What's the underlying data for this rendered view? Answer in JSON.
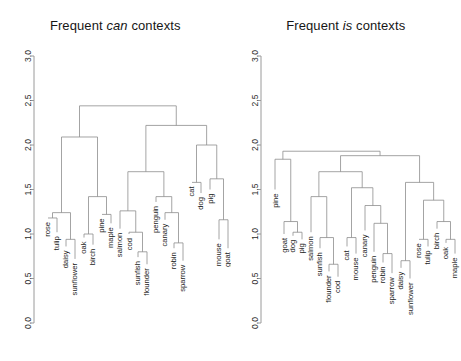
{
  "figure": {
    "background": "#ffffff",
    "line_color": "#8d8d8d",
    "axis_color": "#9a9a9a",
    "text_color": "#1c1c1c"
  },
  "panels": [
    {
      "id": "can-panel",
      "title_prefix": "Frequent ",
      "title_italic": "can",
      "title_suffix": " contexts",
      "title_full": "Frequent can contexts"
    },
    {
      "id": "is-panel",
      "title_prefix": "Frequent ",
      "title_italic": "is",
      "title_suffix": " contexts",
      "title_full": "Frequent is contexts"
    }
  ],
  "axis": {
    "ticks": [
      "0.0",
      "0.5",
      "1.0",
      "1.5",
      "2.0",
      "2.5",
      "3.0"
    ],
    "values": [
      0.0,
      0.5,
      1.0,
      1.5,
      2.0,
      2.5,
      3.0
    ],
    "ylim": [
      0.0,
      3.0
    ],
    "ylabel": ""
  },
  "chart_data": [
    {
      "type": "dendrogram",
      "title": "Frequent can contexts",
      "xlabel": "",
      "ylabel": "",
      "ylim": [
        0.0,
        3.0
      ],
      "grid": false,
      "yticks": [
        0.0,
        0.5,
        1.0,
        1.5,
        2.0,
        2.5,
        3.0
      ],
      "leaves": [
        "rose",
        "tulip",
        "daisy",
        "sunflower",
        "oak",
        "birch",
        "pine",
        "maple",
        "salmon",
        "cod",
        "sunfish",
        "flounder",
        "penguin",
        "canary",
        "robin",
        "sparrow",
        "cat",
        "dog",
        "pig",
        "mouse",
        "goat"
      ],
      "leaf_heights": [
        1.18,
        1.02,
        0.86,
        0.72,
        0.96,
        0.88,
        1.22,
        1.12,
        1.06,
        1.0,
        0.74,
        0.66,
        1.36,
        1.16,
        0.84,
        0.7,
        1.58,
        1.46,
        1.5,
        0.94,
        0.84
      ],
      "merges": [
        {
          "id": "m_rose_tulip",
          "left": "rose",
          "right": "tulip",
          "height": 1.18
        },
        {
          "id": "m_daisy_sunflower",
          "left": "daisy",
          "right": "sunflower",
          "height": 0.94
        },
        {
          "id": "m_flowers",
          "left": "m_rose_tulip",
          "right": "m_daisy_sunflower",
          "height": 1.24
        },
        {
          "id": "m_oak_birch",
          "left": "oak",
          "right": "birch",
          "height": 1.0
        },
        {
          "id": "m_pine_maple",
          "left": "pine",
          "right": "maple",
          "height": 1.22
        },
        {
          "id": "m_trees",
          "left": "m_oak_birch",
          "right": "m_pine_maple",
          "height": 1.42
        },
        {
          "id": "m_plants",
          "left": "m_flowers",
          "right": "m_trees",
          "height": 2.09
        },
        {
          "id": "m_sunfish_flounder",
          "left": "sunfish",
          "right": "flounder",
          "height": 0.8
        },
        {
          "id": "m_cod_group",
          "left": "cod",
          "right": "m_sunfish_flounder",
          "height": 1.02
        },
        {
          "id": "m_fish",
          "left": "salmon",
          "right": "m_cod_group",
          "height": 1.26
        },
        {
          "id": "m_robin_sparrow",
          "left": "robin",
          "right": "sparrow",
          "height": 0.9
        },
        {
          "id": "m_canary_group",
          "left": "canary",
          "right": "m_robin_sparrow",
          "height": 1.24
        },
        {
          "id": "m_birds",
          "left": "penguin",
          "right": "m_canary_group",
          "height": 1.42
        },
        {
          "id": "m_fish_birds",
          "left": "m_fish",
          "right": "m_birds",
          "height": 1.7
        },
        {
          "id": "m_cat_dog",
          "left": "cat",
          "right": "dog",
          "height": 1.58
        },
        {
          "id": "m_mouse_goat",
          "left": "mouse",
          "right": "goat",
          "height": 1.16
        },
        {
          "id": "m_pig_group",
          "left": "pig",
          "right": "m_mouse_goat",
          "height": 1.62
        },
        {
          "id": "m_mammals",
          "left": "m_cat_dog",
          "right": "m_pig_group",
          "height": 2.0
        },
        {
          "id": "m_animals",
          "left": "m_fish_birds",
          "right": "m_mammals",
          "height": 2.22
        },
        {
          "id": "m_root",
          "left": "m_plants",
          "right": "m_animals",
          "height": 2.44
        }
      ]
    },
    {
      "type": "dendrogram",
      "title": "Frequent is contexts",
      "xlabel": "",
      "ylabel": "",
      "ylim": [
        0.0,
        3.0
      ],
      "grid": false,
      "yticks": [
        0.0,
        0.5,
        1.0,
        1.5,
        2.0,
        2.5,
        3.0
      ],
      "leaves": [
        "pine",
        "goat",
        "dog",
        "pig",
        "salmon",
        "sunfish",
        "flounder",
        "cod",
        "cat",
        "mouse",
        "canary",
        "penguin",
        "robin",
        "sparrow",
        "daisy",
        "sunflower",
        "rose",
        "tulip",
        "birch",
        "oak",
        "maple"
      ],
      "leaf_heights": [
        1.5,
        1.0,
        0.98,
        0.94,
        1.02,
        0.84,
        0.58,
        0.52,
        0.86,
        0.78,
        1.04,
        0.8,
        0.68,
        0.56,
        0.62,
        0.5,
        0.94,
        0.86,
        1.06,
        0.9,
        0.78
      ],
      "merges": [
        {
          "id": "m_dog_pig",
          "left": "dog",
          "right": "pig",
          "height": 1.02
        },
        {
          "id": "m_goat_group",
          "left": "goat",
          "right": "m_dog_pig",
          "height": 1.14
        },
        {
          "id": "m_pine_mammals",
          "left": "pine",
          "right": "m_goat_group",
          "height": 1.84
        },
        {
          "id": "m_flounder_cod",
          "left": "flounder",
          "right": "cod",
          "height": 0.66
        },
        {
          "id": "m_sunfish_group",
          "left": "sunfish",
          "right": "m_flounder_cod",
          "height": 0.96
        },
        {
          "id": "m_fish",
          "left": "salmon",
          "right": "m_sunfish_group",
          "height": 1.42
        },
        {
          "id": "m_cat_mouse",
          "left": "cat",
          "right": "mouse",
          "height": 0.96
        },
        {
          "id": "m_robin_sparrow",
          "left": "robin",
          "right": "sparrow",
          "height": 0.78
        },
        {
          "id": "m_penguin_group",
          "left": "penguin",
          "right": "m_robin_sparrow",
          "height": 1.12
        },
        {
          "id": "m_canary_group",
          "left": "canary",
          "right": "m_penguin_group",
          "height": 1.32
        },
        {
          "id": "m_animals2",
          "left": "m_cat_mouse",
          "right": "m_canary_group",
          "height": 1.52
        },
        {
          "id": "m_fish_animals",
          "left": "m_fish",
          "right": "m_animals2",
          "height": 1.7
        },
        {
          "id": "m_daisy_sunflower",
          "left": "daisy",
          "right": "sunflower",
          "height": 0.7
        },
        {
          "id": "m_rose_tulip",
          "left": "rose",
          "right": "tulip",
          "height": 0.94
        },
        {
          "id": "m_oak_maple",
          "left": "oak",
          "right": "maple",
          "height": 0.94
        },
        {
          "id": "m_birch_group",
          "left": "birch",
          "right": "m_oak_maple",
          "height": 1.14
        },
        {
          "id": "m_trees",
          "left": "m_rose_tulip",
          "right": "m_birch_group",
          "height": 1.38
        },
        {
          "id": "m_plants",
          "left": "m_daisy_sunflower",
          "right": "m_trees",
          "height": 1.58
        },
        {
          "id": "m_big",
          "left": "m_fish_animals",
          "right": "m_plants",
          "height": 1.88
        },
        {
          "id": "m_root",
          "left": "m_pine_mammals",
          "right": "m_big",
          "height": 1.93
        }
      ]
    }
  ]
}
